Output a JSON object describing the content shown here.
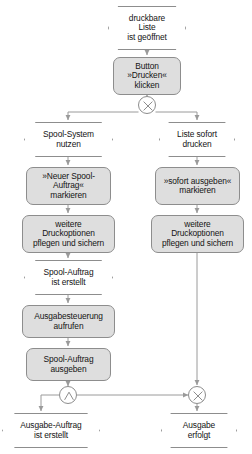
{
  "diagram": {
    "type": "event-driven-process-chain",
    "colors": {
      "function_fill": "#dedede",
      "event_fill": "#ffffff",
      "stroke": "#8d8d8d",
      "text": "#141414",
      "background": "#ffffff"
    },
    "nodes": [
      {
        "id": "ev-start",
        "kind": "event",
        "label": "druckbare\nListe\nist geöffnet",
        "x": 108,
        "y": 6,
        "w": 78,
        "h": 44
      },
      {
        "id": "fn-button-drucken",
        "kind": "function",
        "label": "Button\n»Drucken«\nklicken",
        "x": 113,
        "y": 57,
        "w": 68,
        "h": 38
      },
      {
        "id": "ev-spool-system",
        "kind": "event",
        "label": "Spool-System\nnutzen",
        "x": 24,
        "y": 122,
        "w": 89,
        "h": 35
      },
      {
        "id": "ev-liste-sofort",
        "kind": "event",
        "label": "Liste sofort\ndrucken",
        "x": 159,
        "y": 122,
        "w": 76,
        "h": 35
      },
      {
        "id": "fn-neuer-spool",
        "kind": "function",
        "label": "»Neuer Spool-\nAuftrag«\nmarkieren",
        "x": 26,
        "y": 167,
        "w": 85,
        "h": 38
      },
      {
        "id": "fn-sofort-ausgeben",
        "kind": "function",
        "label": "»sofort ausgeben«\nmarkieren",
        "x": 155,
        "y": 167,
        "w": 85,
        "h": 38
      },
      {
        "id": "fn-weitere-links",
        "kind": "function",
        "label": "weitere\nDruckoptionen\npflegen und sichern",
        "x": 22,
        "y": 215,
        "w": 93,
        "h": 38
      },
      {
        "id": "fn-weitere-rechts",
        "kind": "function",
        "label": "weitere\nDruckoptionen\npflegen und sichern",
        "x": 151,
        "y": 215,
        "w": 93,
        "h": 38
      },
      {
        "id": "ev-spool-auftrag-erstellt",
        "kind": "event",
        "label": "Spool-Auftrag\nist erstellt",
        "x": 24,
        "y": 260,
        "w": 89,
        "h": 35
      },
      {
        "id": "fn-ausgabesteuerung",
        "kind": "function",
        "label": "Ausgabesteuerung\naufrufen",
        "x": 22,
        "y": 305,
        "w": 93,
        "h": 33
      },
      {
        "id": "fn-spool-ausgeben",
        "kind": "function",
        "label": "Spool-Auftrag\nausgeben",
        "x": 26,
        "y": 348,
        "w": 85,
        "h": 33
      },
      {
        "id": "ev-ausgabe-auftrag",
        "kind": "event",
        "label": "Ausgabe-Auftrag\nist erstellt",
        "x": 2,
        "y": 413,
        "w": 98,
        "h": 35
      },
      {
        "id": "ev-ausgabe-erfolgt",
        "kind": "event",
        "label": "Ausgabe\nerfolgt",
        "x": 161,
        "y": 413,
        "w": 76,
        "h": 35
      }
    ],
    "connectors": [
      {
        "id": "conn-xor-split",
        "kind": "xor",
        "symbol": "×",
        "cx": 147,
        "cy": 105,
        "r": 9
      },
      {
        "id": "conn-and-split",
        "kind": "and",
        "symbol": "∧",
        "cx": 68,
        "cy": 395,
        "r": 9
      },
      {
        "id": "conn-xor-join",
        "kind": "xor",
        "symbol": "×",
        "cx": 197,
        "cy": 395,
        "r": 9
      }
    ]
  }
}
